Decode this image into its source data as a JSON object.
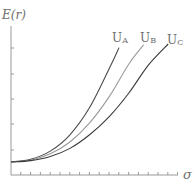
{
  "chart_data": {
    "type": "line",
    "title": "",
    "xlabel": "σ",
    "ylabel": "E(r)",
    "grid": false,
    "legend_position": "inline labels at curve ends",
    "x": [
      0,
      1,
      2,
      3,
      4,
      5,
      6,
      7,
      8,
      9,
      10,
      11,
      12,
      13,
      14,
      15,
      16,
      17
    ],
    "series": [
      {
        "name": "U_A",
        "label_main": "U",
        "label_sub": "A",
        "color": "#4a4a4a",
        "points": [
          [
            0,
            0
          ],
          [
            2,
            0.3
          ],
          [
            4,
            1.2
          ],
          [
            6,
            3.0
          ],
          [
            8,
            6.0
          ],
          [
            10,
            10.3
          ],
          [
            11,
            12.6
          ]
        ]
      },
      {
        "name": "U_B",
        "label_main": "U",
        "label_sub": "B",
        "color": "#9a9a9a",
        "points": [
          [
            0,
            0
          ],
          [
            2,
            0.2
          ],
          [
            4,
            0.9
          ],
          [
            6,
            2.2
          ],
          [
            8,
            4.3
          ],
          [
            10,
            7.2
          ],
          [
            12,
            10.8
          ],
          [
            13.5,
            12.9
          ]
        ]
      },
      {
        "name": "U_C",
        "label_main": "U",
        "label_sub": "C",
        "color": "#3a3a3a",
        "points": [
          [
            0,
            0
          ],
          [
            2,
            0.15
          ],
          [
            4,
            0.6
          ],
          [
            6,
            1.5
          ],
          [
            8,
            3.0
          ],
          [
            10,
            5.0
          ],
          [
            12,
            7.6
          ],
          [
            14,
            10.7
          ],
          [
            16,
            13.0
          ]
        ]
      }
    ],
    "xlim": [
      0,
      17
    ],
    "ylim": [
      -0.8,
      15
    ],
    "x_ticks_count": 17,
    "y_ticks_count": 5
  }
}
